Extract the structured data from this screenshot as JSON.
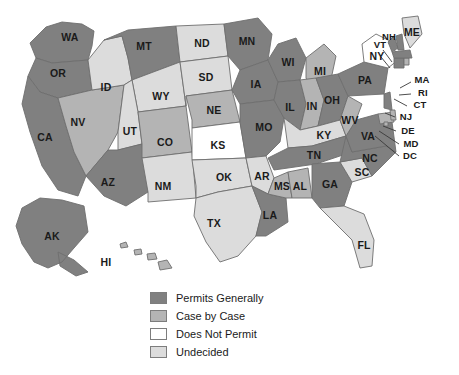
{
  "map": {
    "title": "United States Permit Status Map",
    "projection": "albers-usa"
  },
  "legend": {
    "items": [
      {
        "label": "Permits Generally",
        "color": "#808080",
        "key": "permits"
      },
      {
        "label": "Case by Case",
        "color": "#b4b4b4",
        "key": "case"
      },
      {
        "label": "Does Not Permit",
        "color": "#ffffff",
        "key": "none"
      },
      {
        "label": "Undecided",
        "color": "#dcdcdc",
        "key": "undecided"
      }
    ]
  },
  "colors": {
    "permits": "#808080",
    "case": "#b4b4b4",
    "none": "#ffffff",
    "undecided": "#dcdcdc",
    "outline": "#6e6e6e",
    "leader": "#3a3a3a",
    "text": "#1a1a1a",
    "background": "#ffffff"
  },
  "chart_data": {
    "type": "map",
    "categories": [
      "Permits Generally",
      "Case by Case",
      "Does Not Permit",
      "Undecided"
    ],
    "legend_position": "bottom-center",
    "value_field": "status",
    "states": [
      {
        "abbr": "WA",
        "status": "permits"
      },
      {
        "abbr": "OR",
        "status": "permits"
      },
      {
        "abbr": "CA",
        "status": "permits"
      },
      {
        "abbr": "NV",
        "status": "case"
      },
      {
        "abbr": "ID",
        "status": "undecided"
      },
      {
        "abbr": "MT",
        "status": "permits"
      },
      {
        "abbr": "WY",
        "status": "undecided"
      },
      {
        "abbr": "UT",
        "status": "undecided"
      },
      {
        "abbr": "AZ",
        "status": "permits"
      },
      {
        "abbr": "CO",
        "status": "case"
      },
      {
        "abbr": "NM",
        "status": "undecided"
      },
      {
        "abbr": "ND",
        "status": "undecided"
      },
      {
        "abbr": "SD",
        "status": "undecided"
      },
      {
        "abbr": "NE",
        "status": "case"
      },
      {
        "abbr": "KS",
        "status": "none"
      },
      {
        "abbr": "OK",
        "status": "undecided"
      },
      {
        "abbr": "TX",
        "status": "undecided"
      },
      {
        "abbr": "MN",
        "status": "permits"
      },
      {
        "abbr": "IA",
        "status": "permits"
      },
      {
        "abbr": "MO",
        "status": "permits"
      },
      {
        "abbr": "AR",
        "status": "undecided"
      },
      {
        "abbr": "LA",
        "status": "permits"
      },
      {
        "abbr": "WI",
        "status": "permits"
      },
      {
        "abbr": "IL",
        "status": "permits"
      },
      {
        "abbr": "MI",
        "status": "case"
      },
      {
        "abbr": "IN",
        "status": "case"
      },
      {
        "abbr": "OH",
        "status": "permits"
      },
      {
        "abbr": "KY",
        "status": "undecided"
      },
      {
        "abbr": "TN",
        "status": "permits"
      },
      {
        "abbr": "MS",
        "status": "case"
      },
      {
        "abbr": "AL",
        "status": "case"
      },
      {
        "abbr": "GA",
        "status": "permits"
      },
      {
        "abbr": "FL",
        "status": "undecided"
      },
      {
        "abbr": "SC",
        "status": "undecided"
      },
      {
        "abbr": "NC",
        "status": "permits"
      },
      {
        "abbr": "VA",
        "status": "permits"
      },
      {
        "abbr": "WV",
        "status": "case"
      },
      {
        "abbr": "MD",
        "status": "case"
      },
      {
        "abbr": "DC",
        "status": "case"
      },
      {
        "abbr": "DE",
        "status": "case"
      },
      {
        "abbr": "PA",
        "status": "permits"
      },
      {
        "abbr": "NJ",
        "status": "permits"
      },
      {
        "abbr": "NY",
        "status": "none"
      },
      {
        "abbr": "CT",
        "status": "permits"
      },
      {
        "abbr": "RI",
        "status": "case"
      },
      {
        "abbr": "MA",
        "status": "permits"
      },
      {
        "abbr": "VT",
        "status": "permits"
      },
      {
        "abbr": "NH",
        "status": "permits"
      },
      {
        "abbr": "ME",
        "status": "undecided"
      },
      {
        "abbr": "AK",
        "status": "permits"
      },
      {
        "abbr": "HI",
        "status": "case"
      }
    ]
  }
}
